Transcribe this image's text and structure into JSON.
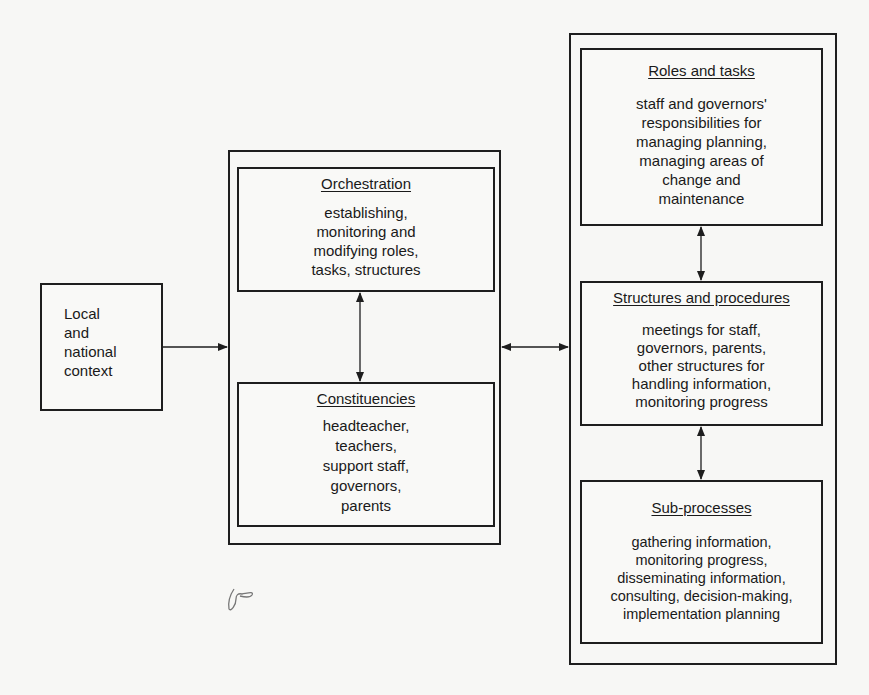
{
  "diagram": {
    "context": {
      "text": "Local\nand\nnational\ncontext"
    },
    "middle_group": {
      "orchestration": {
        "title": "Orchestration",
        "body": "establishing,\nmonitoring and\nmodifying roles,\ntasks, structures"
      },
      "constituencies": {
        "title": "Constituencies",
        "body": "headteacher,\nteachers,\nsupport staff,\ngovernors,\nparents"
      }
    },
    "right_group": {
      "roles_and_tasks": {
        "title": "Roles and tasks",
        "body": "staff and governors'\nresponsibilities for\nmanaging planning,\nmanaging areas of\nchange and\nmaintenance"
      },
      "structures_and_procedures": {
        "title": "Structures and procedures",
        "body": "meetings for staff,\ngovernors, parents,\nother structures for\nhandling information,\nmonitoring progress"
      },
      "sub_processes": {
        "title": "Sub-processes",
        "body": "gathering information,\nmonitoring progress,\ndisseminating information,\nconsulting, decision-making,\nimplementation planning"
      }
    },
    "connections": [
      {
        "from": "context",
        "to": "middle_group",
        "type": "single-arrow"
      },
      {
        "from": "orchestration",
        "to": "constituencies",
        "type": "double-arrow"
      },
      {
        "from": "middle_group",
        "to": "right_group",
        "type": "double-arrow"
      },
      {
        "from": "roles_and_tasks",
        "to": "structures_and_procedures",
        "type": "double-arrow"
      },
      {
        "from": "structures_and_procedures",
        "to": "sub_processes",
        "type": "double-arrow"
      }
    ],
    "colors": {
      "line": "#1e1e1e",
      "paper": "#f7f7f5"
    }
  }
}
